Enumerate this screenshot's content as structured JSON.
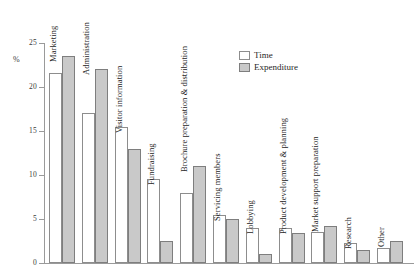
{
  "chart_data": {
    "type": "bar",
    "title": "",
    "xlabel": "",
    "ylabel": "%",
    "ylim": [
      0,
      25
    ],
    "yticks": [
      0,
      5,
      10,
      15,
      20,
      25
    ],
    "grid": false,
    "legend_position": "top-right",
    "categories": [
      "Marketing",
      "Administration",
      "Visitor information",
      "Fundraising",
      "Brochure preparation & distribution",
      "Servicing members",
      "Lobbying",
      "Product development & planning",
      "Market support preparation",
      "Research",
      "Other"
    ],
    "series": [
      {
        "name": "Time",
        "color": "#ffffff",
        "values": [
          21.6,
          17.0,
          15.4,
          9.5,
          8.0,
          5.5,
          4.0,
          4.0,
          3.5,
          2.3,
          1.7
        ]
      },
      {
        "name": "Expenditure",
        "color": "#c9c9c9",
        "values": [
          23.5,
          22.0,
          13.0,
          2.5,
          11.0,
          5.0,
          1.0,
          3.4,
          4.2,
          1.5,
          2.5
        ]
      }
    ]
  },
  "legend": {
    "items": [
      {
        "label": "Time"
      },
      {
        "label": "Expenditure"
      }
    ]
  },
  "axis": {
    "unit": "%",
    "tick_labels": [
      "25",
      "20",
      "15",
      "10",
      "5",
      "0"
    ]
  }
}
